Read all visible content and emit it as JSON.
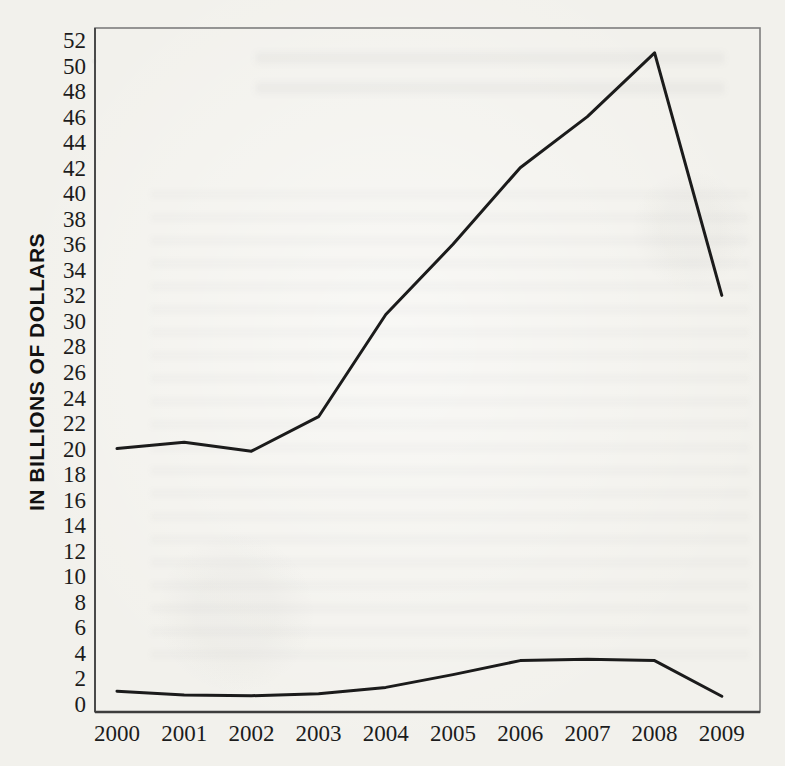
{
  "figure": {
    "background_color": "#f2f1ec",
    "frame_color": "#7d7d7d",
    "line_color": "#1b1b1b",
    "label_color": "#1c1c1c"
  },
  "chart_data": {
    "type": "line",
    "title": "",
    "xlabel": "",
    "ylabel": "IN BILLIONS OF DOLLARS",
    "categories": [
      "2000",
      "2001",
      "2002",
      "2003",
      "2004",
      "2005",
      "2006",
      "2007",
      "2008",
      "2009"
    ],
    "series": [
      {
        "name": "upper-line",
        "values": [
          20,
          20.5,
          19.8,
          22.5,
          30.5,
          36,
          42,
          46,
          51,
          32
        ]
      },
      {
        "name": "lower-line",
        "values": [
          1,
          0.7,
          0.65,
          0.8,
          1.3,
          2.3,
          3.4,
          3.5,
          3.4,
          0.6
        ]
      }
    ],
    "ylim": [
      0,
      52
    ],
    "ytick_step": 2,
    "yticks": [
      0,
      2,
      4,
      6,
      8,
      10,
      12,
      14,
      16,
      18,
      20,
      22,
      24,
      26,
      28,
      30,
      32,
      34,
      36,
      38,
      40,
      42,
      44,
      46,
      48,
      50,
      52
    ],
    "grid": false,
    "legend": "none"
  }
}
